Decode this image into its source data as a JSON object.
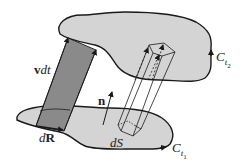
{
  "figure": {
    "type": "diagram",
    "colors": {
      "surface_fill": "#d4d4d4",
      "swept_strip_fill": "#8a8a8a",
      "outline": "#1a1a1a",
      "background": "#ffffff"
    }
  },
  "labels": {
    "vdt": {
      "v": "v",
      "rest": "dt"
    },
    "n": "n",
    "dR": {
      "d": "d",
      "R": "R"
    },
    "dS": "dS",
    "Ct2": {
      "C": "C",
      "t": "t",
      "sub": "2"
    },
    "Ct1": {
      "C": "C",
      "t": "t",
      "sub": "1"
    }
  }
}
